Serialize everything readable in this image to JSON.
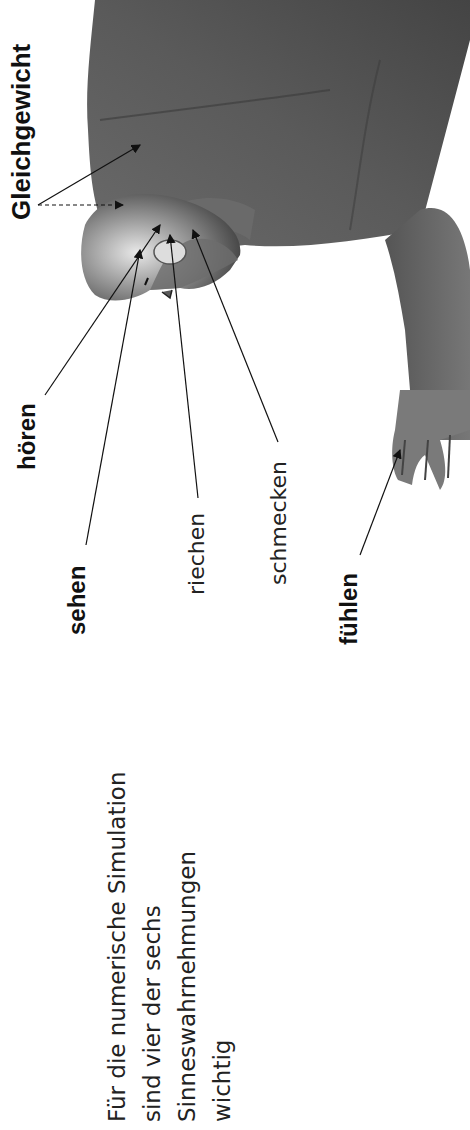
{
  "figure": {
    "labels": {
      "balance": "Gleichgewicht",
      "hearing": "hören",
      "seeing": "sehen",
      "smelling": "riechen",
      "tasting": "schmecken",
      "feeling": "fühlen"
    }
  },
  "caption": {
    "lines": [
      "Für die numerische Simulation",
      "sind vier der sechs",
      "Sinneswahrnehmungen",
      "wichtig"
    ]
  },
  "colors": {
    "background": "#ffffff",
    "text": "#1a1a1a",
    "figure_dark": "#3a3a3a",
    "figure_mid": "#6e6e6e",
    "figure_light": "#bdbdbd"
  }
}
